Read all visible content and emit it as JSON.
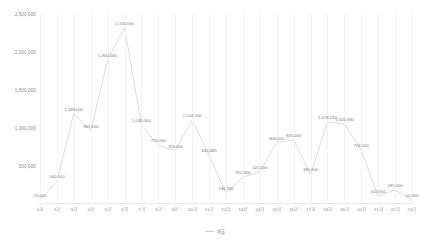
{
  "chart_data": {
    "type": "line",
    "title": "",
    "xlabel": "",
    "ylabel": "",
    "grid": "vertical",
    "legend_position": "bottom",
    "ylim": [
      0,
      2500000
    ],
    "yticks": [
      500000,
      1000000,
      1500000,
      2000000,
      2500000
    ],
    "ytick_labels": [
      "500,000",
      "1,000,000",
      "1,500,000",
      "2,000,000",
      "2,500,000"
    ],
    "categories": [
      "1기",
      "2기",
      "3기",
      "4기",
      "5기",
      "6기",
      "7기",
      "8기",
      "9기",
      "10기",
      "11기",
      "12기",
      "13기",
      "14기",
      "15기",
      "16기",
      "17기",
      "18기",
      "19기",
      "20기",
      "21기",
      "22기",
      "23기"
    ],
    "series": [
      {
        "name": "매출",
        "color": "#cccccc",
        "values": [
          50000,
          300000,
          1188000,
          960000,
          1900000,
          2320000,
          1040000,
          770000,
          703000,
          1104000,
          640680,
          146700,
          352400,
          425500,
          806000,
          845000,
          390000,
          1078130,
          1056690,
          706160,
          102000,
          185000,
          50000
        ],
        "data_labels": [
          "50,000",
          "300,000",
          "1,188,000",
          "960,000",
          "1,900,000",
          "2,320,000",
          "1,040,000",
          "770,000",
          "703,000",
          "1,104,000",
          "640,680",
          "146,700",
          "352,400",
          "425,500",
          "806,000",
          "845,000",
          "390,000",
          "1,078,130",
          "1,056,690",
          "706,160",
          "102,000",
          "185,000",
          "50,000"
        ]
      }
    ]
  },
  "legend": {
    "items": [
      {
        "label": "매출",
        "color": "#cccccc"
      }
    ]
  }
}
